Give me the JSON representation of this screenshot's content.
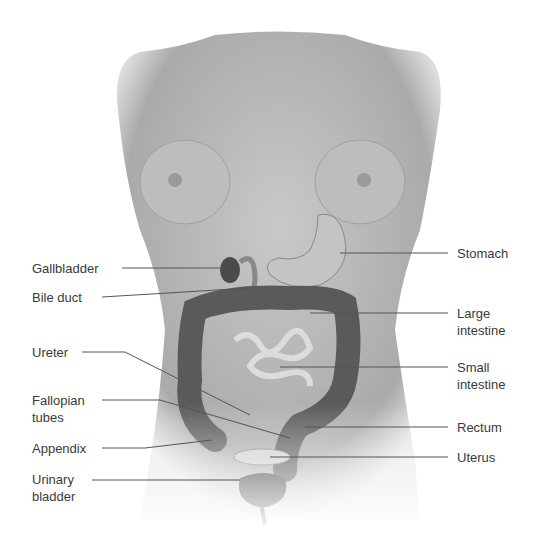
{
  "diagram": {
    "labels_left": [
      {
        "id": "gallbladder",
        "text": "Gallbladder"
      },
      {
        "id": "bile-duct",
        "text": "Bile duct"
      },
      {
        "id": "ureter",
        "text": "Ureter"
      },
      {
        "id": "fallopian-tubes",
        "text": "Fallopian\ntubes"
      },
      {
        "id": "appendix",
        "text": "Appendix"
      },
      {
        "id": "urinary-bladder",
        "text": "Urinary\nbladder"
      }
    ],
    "labels_right": [
      {
        "id": "stomach",
        "text": "Stomach"
      },
      {
        "id": "large-intestine",
        "text": "Large\nintestine"
      },
      {
        "id": "small-intestine",
        "text": "Small\nintestine"
      },
      {
        "id": "rectum",
        "text": "Rectum"
      },
      {
        "id": "uterus",
        "text": "Uterus"
      }
    ],
    "colors": {
      "skin": "#b8b8b8",
      "organ_dark": "#5a5a5a",
      "organ_light": "#d6d6d6",
      "leader": "#555555",
      "text": "#3a3a3a"
    }
  }
}
